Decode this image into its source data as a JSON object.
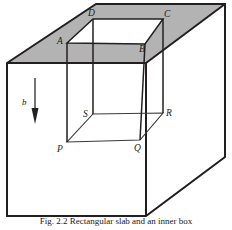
{
  "figure": {
    "type": "geometric-diagram",
    "caption": "Fig. 2.2   Rectangular slab and an inner box",
    "colors": {
      "line": "#231f20",
      "shaded_top_face": "#b3b3b3",
      "background": "#ffffff",
      "thin_line": "#3a3a3a"
    },
    "outer_block": {
      "name": "rectangular-slab",
      "top_face_shaded": true,
      "points": {
        "top_left": [
          7,
          63
        ],
        "top_back_left": [
          96,
          4
        ],
        "top_back_right": [
          225,
          4
        ],
        "top_right": [
          146,
          63
        ],
        "bottom_left": [
          7,
          216
        ],
        "bottom_right": [
          146,
          216
        ],
        "bottom_back_right": [
          225,
          157
        ]
      }
    },
    "inner_box": {
      "name": "inner-rectangular-box",
      "vertices": {
        "A": [
          67,
          43
        ],
        "B": [
          145,
          44
        ],
        "C": [
          163,
          19
        ],
        "D": [
          93,
          19
        ],
        "P": [
          67,
          142
        ],
        "Q": [
          140,
          140
        ],
        "R": [
          163,
          113
        ],
        "S": [
          93,
          114
        ]
      }
    },
    "vector": {
      "name": "b-vector",
      "label": "b",
      "direction": "down",
      "tail": [
        35,
        78
      ],
      "head": [
        35,
        123
      ],
      "label_pos": [
        25,
        103
      ]
    },
    "labels": {
      "A": "A",
      "B": "B",
      "C": "C",
      "D": "D",
      "P": "P",
      "Q": "Q",
      "R": "R",
      "S": "S",
      "b": "b"
    }
  }
}
